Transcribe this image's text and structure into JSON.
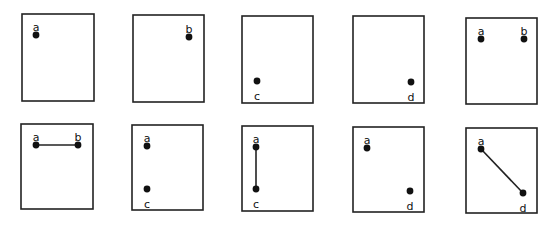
{
  "panels": [
    {
      "id": "p1",
      "box": [
        22,
        14,
        72,
        87
      ],
      "points": [
        {
          "label": "a",
          "x": 36,
          "y": 35,
          "lx": 36,
          "ly": 27
        }
      ],
      "edges": []
    },
    {
      "id": "p2",
      "box": [
        133,
        15,
        71,
        87
      ],
      "points": [
        {
          "label": "b",
          "x": 189,
          "y": 37,
          "lx": 189,
          "ly": 29
        }
      ],
      "edges": []
    },
    {
      "id": "p3",
      "box": [
        242,
        16,
        71,
        87
      ],
      "points": [
        {
          "label": "c",
          "x": 257,
          "y": 81,
          "lx": 257,
          "ly": 96
        }
      ],
      "edges": []
    },
    {
      "id": "p4",
      "box": [
        353,
        16,
        71,
        87
      ],
      "points": [
        {
          "label": "d",
          "x": 411,
          "y": 82,
          "lx": 411,
          "ly": 97
        }
      ],
      "edges": []
    },
    {
      "id": "p5",
      "box": [
        466,
        18,
        71,
        86
      ],
      "points": [
        {
          "label": "a",
          "x": 481,
          "y": 39,
          "lx": 481,
          "ly": 31
        },
        {
          "label": "b",
          "x": 524,
          "y": 39,
          "lx": 524,
          "ly": 31
        }
      ],
      "edges": []
    },
    {
      "id": "p6",
      "box": [
        21,
        124,
        72,
        85
      ],
      "points": [
        {
          "label": "a",
          "x": 36,
          "y": 145,
          "lx": 36,
          "ly": 137
        },
        {
          "label": "b",
          "x": 78,
          "y": 145,
          "lx": 78,
          "ly": 137
        }
      ],
      "edges": [
        [
          "a",
          "b"
        ]
      ]
    },
    {
      "id": "p7",
      "box": [
        132,
        125,
        71,
        85
      ],
      "points": [
        {
          "label": "a",
          "x": 147,
          "y": 146,
          "lx": 147,
          "ly": 138
        },
        {
          "label": "c",
          "x": 147,
          "y": 189,
          "lx": 147,
          "ly": 204
        }
      ],
      "edges": []
    },
    {
      "id": "p8",
      "box": [
        242,
        126,
        71,
        85
      ],
      "points": [
        {
          "label": "a",
          "x": 256,
          "y": 147,
          "lx": 256,
          "ly": 139
        },
        {
          "label": "c",
          "x": 256,
          "y": 189,
          "lx": 256,
          "ly": 204
        }
      ],
      "edges": [
        [
          "a",
          "c"
        ]
      ]
    },
    {
      "id": "p9",
      "box": [
        353,
        127,
        71,
        85
      ],
      "points": [
        {
          "label": "a",
          "x": 367,
          "y": 148,
          "lx": 367,
          "ly": 140
        },
        {
          "label": "d",
          "x": 410,
          "y": 191,
          "lx": 410,
          "ly": 206
        }
      ],
      "edges": []
    },
    {
      "id": "p10",
      "box": [
        466,
        128,
        71,
        85
      ],
      "points": [
        {
          "label": "a",
          "x": 481,
          "y": 149,
          "lx": 481,
          "ly": 141
        },
        {
          "label": "d",
          "x": 523,
          "y": 193,
          "lx": 523,
          "ly": 208
        }
      ],
      "edges": [
        [
          "a",
          "d"
        ]
      ]
    }
  ]
}
